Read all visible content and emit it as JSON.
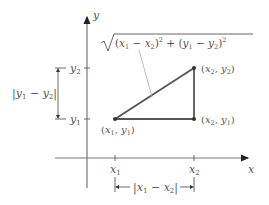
{
  "diagram": {
    "axes": {
      "x_label": "x",
      "y_label": "y"
    },
    "ticks": {
      "x1": "x",
      "x1_sub": "1",
      "x2": "x",
      "x2_sub": "2",
      "y1": "y",
      "y1_sub": "1",
      "y2": "y",
      "y2_sub": "2"
    },
    "points": [
      {
        "name": "(x1, y1)",
        "x_sub": "1",
        "y_sub": "1"
      },
      {
        "name": "(x2, y2)",
        "x_sub": "2",
        "y_sub": "2"
      },
      {
        "name": "(x2, y1)",
        "x_sub": "2",
        "y_sub": "1"
      }
    ],
    "formula": "√((x1 − x2)² + (y1 − y2)²)",
    "horizontal_distance": "|x1 − x2|",
    "vertical_distance": "|y1 − y2|",
    "colors": {
      "axis": "#666666",
      "triangle": "#555555",
      "leader": "#aaaaaa",
      "text": "#555555"
    }
  }
}
